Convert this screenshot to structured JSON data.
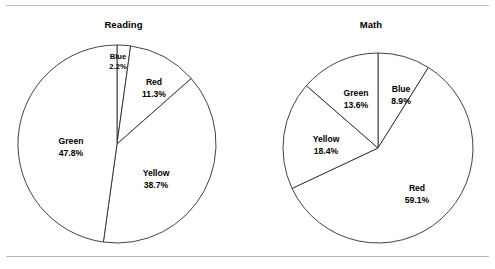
{
  "page": {
    "background_color": "#ffffff",
    "rule_color": "#b9b9bd",
    "outline_color": "#2c2c2c"
  },
  "chart_data": [
    {
      "type": "pie",
      "title": "Reading",
      "xlabel": "",
      "ylabel": "",
      "legend_position": "none",
      "grid": false,
      "labels_on_slices": true,
      "start_angle_deg": 0,
      "direction": "clockwise",
      "categories": [
        "Blue",
        "Red",
        "Yellow",
        "Green"
      ],
      "values": [
        2.2,
        11.3,
        38.7,
        47.8
      ],
      "value_suffix": "%",
      "slices": [
        {
          "name": "Blue",
          "value": 2.2,
          "value_label": "2.2%",
          "label_x": 118,
          "label_y": 61,
          "tiny": true
        },
        {
          "name": "Red",
          "value": 11.3,
          "value_label": "11.3%",
          "label_x": 154,
          "label_y": 88,
          "tiny": false
        },
        {
          "name": "Yellow",
          "value": 38.7,
          "value_label": "38.7%",
          "label_x": 156,
          "label_y": 179,
          "tiny": false
        },
        {
          "name": "Green",
          "value": 47.8,
          "value_label": "47.8%",
          "label_x": 71,
          "label_y": 147,
          "tiny": false
        }
      ],
      "geometry": {
        "cx": 117,
        "cy": 144,
        "r": 99
      }
    },
    {
      "type": "pie",
      "title": "Math",
      "xlabel": "",
      "ylabel": "",
      "legend_position": "none",
      "grid": false,
      "labels_on_slices": true,
      "start_angle_deg": 0,
      "direction": "clockwise",
      "categories": [
        "Blue",
        "Red",
        "Yellow",
        "Green"
      ],
      "values": [
        8.9,
        59.1,
        18.4,
        13.6
      ],
      "value_suffix": "%",
      "slices": [
        {
          "name": "Blue",
          "value": 8.9,
          "value_label": "8.9%",
          "label_x": 401,
          "label_y": 95,
          "tiny": false
        },
        {
          "name": "Red",
          "value": 59.1,
          "value_label": "59.1%",
          "label_x": 417,
          "label_y": 194,
          "tiny": false
        },
        {
          "name": "Yellow",
          "value": 18.4,
          "value_label": "18.4%",
          "label_x": 326,
          "label_y": 145,
          "tiny": false
        },
        {
          "name": "Green",
          "value": 13.6,
          "value_label": "13.6%",
          "label_x": 356,
          "label_y": 99,
          "tiny": false
        }
      ],
      "geometry": {
        "cx": 378,
        "cy": 148,
        "r": 95
      }
    }
  ]
}
